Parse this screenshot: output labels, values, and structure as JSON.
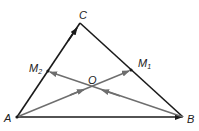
{
  "diagram": {
    "type": "geometry-triangle-vectors",
    "colors": {
      "triangle": "#1a1a1a",
      "median": "#6e6e6e",
      "label": "#222222",
      "background": "#ffffff"
    },
    "points": {
      "A": {
        "label": "A",
        "x": 17,
        "y": 117
      },
      "B": {
        "label": "B",
        "x": 183,
        "y": 117
      },
      "C": {
        "label": "C",
        "x": 80,
        "y": 23
      },
      "M1": {
        "label": "M",
        "sub": "1",
        "x": 131,
        "y": 70
      },
      "M2": {
        "label": "M",
        "sub": "2",
        "x": 48,
        "y": 71
      },
      "O": {
        "label": "O",
        "x": 92,
        "y": 87
      }
    },
    "vectors": [
      {
        "from": "A",
        "to": "C",
        "style": "triangle"
      },
      {
        "from": "A",
        "to": "B",
        "style": "triangle"
      },
      {
        "from": "A",
        "to": "M1",
        "style": "median"
      },
      {
        "from": "B",
        "to": "M2",
        "style": "median"
      }
    ],
    "segments": [
      {
        "from": "C",
        "to": "B",
        "style": "triangle"
      }
    ]
  }
}
